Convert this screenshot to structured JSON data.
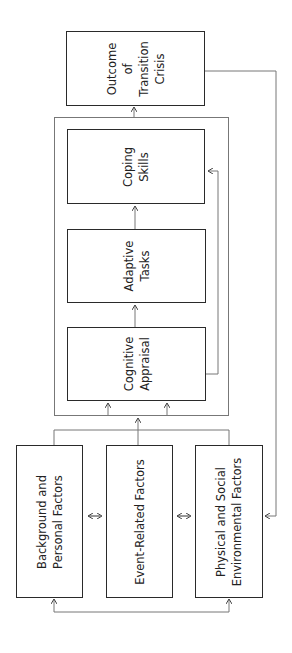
{
  "diagram": {
    "orientation": "rotated-90-ccw",
    "outcome": {
      "lines": [
        "Outcome",
        "of",
        "Transition",
        "Crisis"
      ]
    },
    "process_frame": {
      "coping": {
        "lines": [
          "Coping",
          "Skills"
        ]
      },
      "adaptive": {
        "lines": [
          "Adaptive",
          "Tasks"
        ]
      },
      "cognitive": {
        "lines": [
          "Cognitive",
          "Appraisal"
        ]
      }
    },
    "factors": {
      "background": {
        "lines": [
          "Background and",
          "Personal Factors"
        ]
      },
      "event": {
        "lines": [
          "Event-Related Factors"
        ]
      },
      "environment": {
        "lines": [
          "Physical and Social",
          "Environmental Factors"
        ]
      }
    },
    "colors": {
      "box_border": "#2a2a2a",
      "connector": "#777777",
      "background": "#ffffff"
    }
  }
}
